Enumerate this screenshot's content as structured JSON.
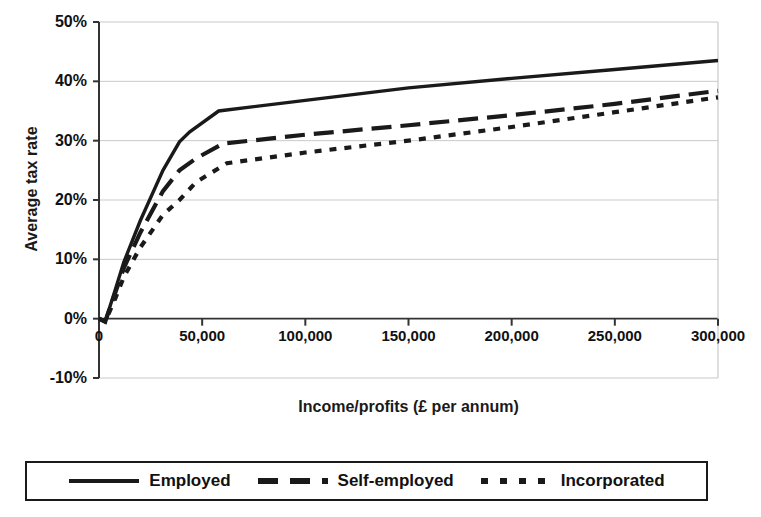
{
  "chart_data": {
    "type": "line",
    "title": "",
    "xlabel": "Income/profits (£ per annum)",
    "ylabel": "Average tax rate",
    "xlim": [
      0,
      300000
    ],
    "ylim": [
      -10,
      50
    ],
    "grid": true,
    "legend_position": "bottom",
    "x_ticks": [
      0,
      50000,
      100000,
      150000,
      200000,
      250000,
      300000
    ],
    "x_tick_labels": [
      "0",
      "50,000",
      "100,000",
      "150,000",
      "200,000",
      "250,000",
      "300,000"
    ],
    "y_ticks": [
      -10,
      0,
      10,
      20,
      30,
      40,
      50
    ],
    "y_tick_labels": [
      "-10%",
      "0%",
      "10%",
      "20%",
      "30%",
      "40%",
      "50%"
    ],
    "series": [
      {
        "name": "Employed",
        "style": "solid",
        "color": "#1a1a1a",
        "x": [
          0,
          3000,
          8000,
          12000,
          20000,
          31000,
          39000,
          44000,
          58000,
          100000,
          150000,
          200000,
          250000,
          300000
        ],
        "y": [
          0,
          -0.5,
          5.0,
          9.5,
          16.5,
          25.0,
          29.8,
          31.5,
          35.0,
          36.8,
          38.9,
          40.5,
          42.0,
          43.5
        ]
      },
      {
        "name": "Self-employed",
        "style": "dashed",
        "color": "#1a1a1a",
        "x": [
          0,
          3000,
          8000,
          12000,
          20000,
          31000,
          39000,
          47000,
          60000,
          100000,
          150000,
          200000,
          250000,
          300000
        ],
        "y": [
          0,
          -0.5,
          4.5,
          8.5,
          14.5,
          21.5,
          25.0,
          27.0,
          29.5,
          31.0,
          32.6,
          34.3,
          36.2,
          38.4
        ]
      },
      {
        "name": "Incorporated",
        "style": "dotted",
        "color": "#1a1a1a",
        "x": [
          0,
          3000,
          8000,
          12000,
          20000,
          31000,
          39000,
          47000,
          62000,
          100000,
          150000,
          200000,
          250000,
          300000
        ],
        "y": [
          0,
          -0.5,
          3.5,
          7.0,
          12.0,
          17.5,
          20.0,
          23.0,
          26.2,
          28.0,
          30.0,
          32.3,
          34.8,
          37.3
        ]
      }
    ]
  },
  "legend": {
    "entries": [
      {
        "label": "Employed",
        "style": "solid"
      },
      {
        "label": "Self-employed",
        "style": "dashed"
      },
      {
        "label": "Incorporated",
        "style": "dotted"
      }
    ]
  },
  "axes": {
    "plot_left": 99,
    "plot_right": 718,
    "plot_top": 22,
    "plot_bottom": 378,
    "zero_line": 318
  },
  "colors": {
    "line": "#1a1a1a",
    "grid": "#c9c9c9",
    "axis": "#333333",
    "background": "#ffffff"
  }
}
